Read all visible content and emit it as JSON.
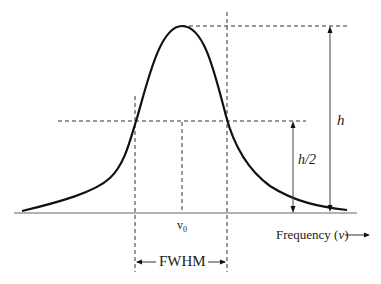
{
  "diagram": {
    "labels": {
      "peak_height": "h",
      "half_height": "h/2",
      "center": "v",
      "center_sub": "0",
      "width": "FWHM",
      "x_axis": "Frequency (",
      "x_axis_var": "v",
      "x_axis_close": ")"
    },
    "colors": {
      "line": "#111111",
      "axis": "#888888",
      "dash": "#333333"
    }
  }
}
